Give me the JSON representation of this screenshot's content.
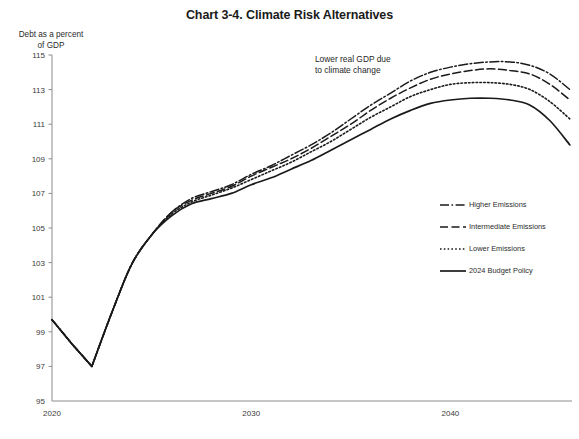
{
  "chart_data": {
    "type": "line",
    "title": "Chart 3-4. Climate Risk Alternatives",
    "ylabel": "Debt as a percent\nof GDP",
    "ylabel_line1": "Debt as a percent",
    "ylabel_line2": "of GDP",
    "xlabel": "",
    "ylim": [
      95,
      115
    ],
    "xlim": [
      2020,
      2046
    ],
    "yticks": [
      95,
      97,
      99,
      101,
      103,
      105,
      107,
      109,
      111,
      113,
      115
    ],
    "ytick_labels": [
      "95",
      "97",
      "99",
      "101",
      "103",
      "105",
      "107",
      "109",
      "111",
      "113",
      "115"
    ],
    "xticks": [
      2020,
      2030,
      2040
    ],
    "xtick_labels": [
      "2020",
      "2030",
      "2040"
    ],
    "grid": false,
    "legend_position": "center-right",
    "annotations": [
      {
        "name": "lower-real-gdp-note",
        "line1": "Lower real GDP due",
        "line2": "to climate change",
        "x": 2033.2,
        "y": 114.6
      }
    ],
    "x": [
      2020,
      2021,
      2022,
      2023,
      2024,
      2025,
      2026,
      2027,
      2028,
      2029,
      2030,
      2031,
      2032,
      2033,
      2034,
      2035,
      2036,
      2037,
      2038,
      2039,
      2040,
      2041,
      2042,
      2043,
      2044,
      2045,
      2046
    ],
    "series": [
      {
        "name": "Higher Emissions",
        "style": "dashdot",
        "dash": "9,2.5,1.6,2.5",
        "width": 1.5,
        "color": "#1a1a1a",
        "values": [
          99.7,
          98.3,
          97.0,
          100.1,
          102.9,
          104.6,
          105.9,
          106.7,
          107.1,
          107.5,
          108.1,
          108.6,
          109.2,
          109.8,
          110.5,
          111.3,
          112.1,
          112.8,
          113.5,
          114.0,
          114.3,
          114.5,
          114.6,
          114.6,
          114.4,
          113.9,
          113.0
        ]
      },
      {
        "name": "Intermediate Emissions",
        "style": "dashed",
        "dash": "8,3.5",
        "width": 1.5,
        "color": "#1a1a1a",
        "values": [
          99.7,
          98.3,
          97.0,
          100.1,
          102.9,
          104.6,
          105.9,
          106.6,
          107.0,
          107.4,
          108.0,
          108.5,
          109.0,
          109.6,
          110.3,
          111.0,
          111.8,
          112.5,
          113.1,
          113.6,
          113.9,
          114.1,
          114.2,
          114.1,
          113.9,
          113.3,
          112.4
        ]
      },
      {
        "name": "Lower Emissions",
        "style": "dotted",
        "dash": "1.6,2.2",
        "width": 1.6,
        "color": "#1a1a1a",
        "values": [
          99.7,
          98.3,
          97.0,
          100.1,
          102.9,
          104.6,
          105.8,
          106.5,
          106.9,
          107.3,
          107.8,
          108.3,
          108.8,
          109.4,
          110.0,
          110.7,
          111.4,
          112.0,
          112.6,
          113.0,
          113.3,
          113.4,
          113.4,
          113.3,
          113.0,
          112.3,
          111.3
        ]
      },
      {
        "name": "2024 Budget Policy",
        "style": "solid",
        "dash": "",
        "width": 1.7,
        "color": "#1a1a1a",
        "values": [
          99.7,
          98.3,
          97.0,
          100.1,
          102.9,
          104.6,
          105.7,
          106.4,
          106.7,
          107.0,
          107.5,
          107.9,
          108.4,
          108.9,
          109.5,
          110.1,
          110.7,
          111.3,
          111.8,
          112.2,
          112.4,
          112.5,
          112.5,
          112.4,
          112.1,
          111.2,
          109.8
        ]
      }
    ],
    "legend_entries": [
      {
        "label": "Higher Emissions",
        "style": "dashdot"
      },
      {
        "label": "Intermediate Emissions",
        "style": "dashed"
      },
      {
        "label": "Lower Emissions",
        "style": "dotted"
      },
      {
        "label": "2024 Budget Policy",
        "style": "solid"
      }
    ]
  }
}
